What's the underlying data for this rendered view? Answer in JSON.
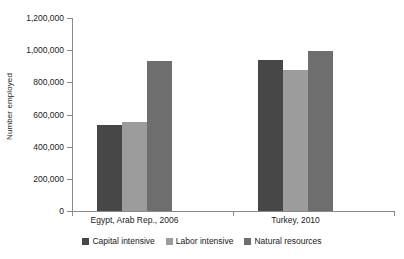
{
  "chart_data": {
    "type": "bar",
    "title": "",
    "xlabel": "",
    "ylabel": "Number employed",
    "ylim": [
      0,
      1200000
    ],
    "grid": false,
    "legend_position": "bottom",
    "categories": [
      "Egypt, Arab Rep., 2006",
      "Turkey, 2010"
    ],
    "ytick_labels": [
      "0",
      "200,000",
      "400,000",
      "600,000",
      "800,000",
      "1,000,000",
      "1,200,000"
    ],
    "ytick_values": [
      0,
      200000,
      400000,
      600000,
      800000,
      1000000,
      1200000
    ],
    "series": [
      {
        "name": "Capital intensive",
        "color": "#474747",
        "values": [
          535000,
          940000
        ]
      },
      {
        "name": "Labor intensive",
        "color": "#9c9c9c",
        "values": [
          555000,
          875000
        ]
      },
      {
        "name": "Natural resources",
        "color": "#6e6e6e",
        "values": [
          930000,
          995000
        ]
      }
    ]
  }
}
